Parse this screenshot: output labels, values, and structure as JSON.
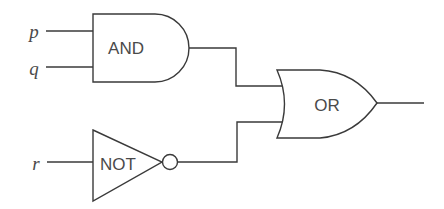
{
  "diagram": {
    "type": "logic-circuit",
    "inputs": [
      {
        "id": "p",
        "label": "p"
      },
      {
        "id": "q",
        "label": "q"
      },
      {
        "id": "r",
        "label": "r"
      }
    ],
    "gates": [
      {
        "id": "and",
        "label": "AND",
        "inputs": [
          "p",
          "q"
        ]
      },
      {
        "id": "not",
        "label": "NOT",
        "inputs": [
          "r"
        ]
      },
      {
        "id": "or",
        "label": "OR",
        "inputs": [
          "and",
          "not"
        ]
      }
    ],
    "stroke_color": "#3a3a3a",
    "text_color": "#4a4a4a",
    "background": "#ffffff"
  }
}
